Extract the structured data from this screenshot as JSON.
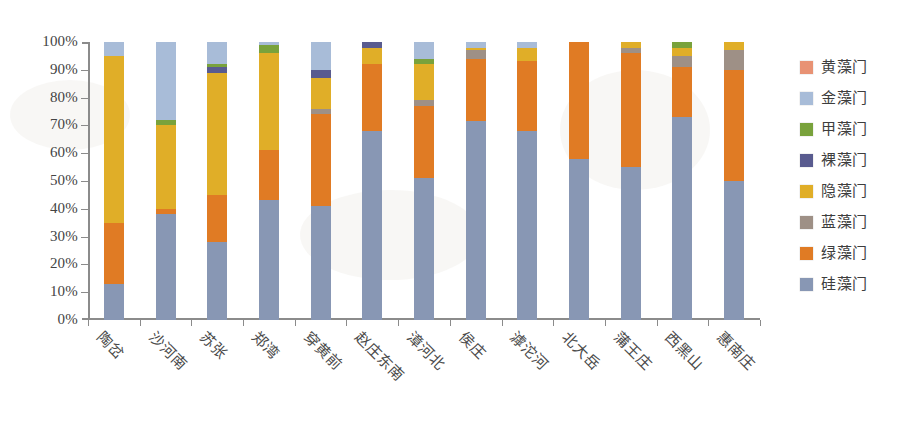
{
  "chart_data": {
    "type": "bar",
    "subtype": "stacked-percent",
    "title": "",
    "xlabel": "",
    "ylabel": "",
    "ylim": [
      0,
      100
    ],
    "ytick_labels": [
      "0%",
      "10%",
      "20%",
      "30%",
      "40%",
      "50%",
      "60%",
      "70%",
      "80%",
      "90%",
      "100%"
    ],
    "ytick_values": [
      0,
      10,
      20,
      30,
      40,
      50,
      60,
      70,
      80,
      90,
      100
    ],
    "grid": false,
    "legend_position": "right",
    "stack_order_bottom_to_top": [
      "硅藻门",
      "绿藻门",
      "蓝藻门",
      "隐藻门",
      "裸藻门",
      "甲藻门",
      "金藻门",
      "黄藻门"
    ],
    "categories": [
      "陶岔",
      "沙河南",
      "苏张",
      "郑湾",
      "穿黄前",
      "赵庄东南",
      "漳河北",
      "侯庄",
      "滹沱河",
      "北大岳",
      "蒲王庄",
      "西黑山",
      "惠南庄"
    ],
    "series": [
      {
        "name": "硅藻门",
        "color": "#8897b4",
        "values": [
          13,
          38,
          28,
          43,
          41,
          68,
          51,
          71.5,
          68,
          58,
          55,
          73,
          50
        ]
      },
      {
        "name": "绿藻门",
        "color": "#e07b24",
        "values": [
          22,
          2,
          17,
          18,
          33,
          24,
          26,
          22.5,
          25,
          42,
          41,
          18,
          40
        ]
      },
      {
        "name": "蓝藻门",
        "color": "#9e9086",
        "values": [
          0,
          0,
          0,
          0,
          2,
          0,
          2,
          3,
          0,
          0,
          2,
          4,
          7
        ]
      },
      {
        "name": "隐藻门",
        "color": "#e0ae28",
        "values": [
          60,
          30,
          44,
          35,
          11,
          6,
          13,
          1,
          5,
          0,
          2,
          3,
          3
        ]
      },
      {
        "name": "裸藻门",
        "color": "#595b8f",
        "values": [
          0,
          0,
          2,
          0,
          3,
          2,
          0,
          0,
          0,
          0,
          0,
          0,
          0
        ]
      },
      {
        "name": "甲藻门",
        "color": "#79a23c",
        "values": [
          0,
          2,
          1,
          3,
          0,
          0,
          2,
          0,
          0,
          0,
          0,
          2,
          0
        ]
      },
      {
        "name": "金藻门",
        "color": "#a8bcd8",
        "values": [
          5,
          28,
          8,
          1,
          10,
          0,
          6,
          2,
          2,
          0,
          0,
          0,
          0
        ]
      },
      {
        "name": "黄藻门",
        "color": "#e89274",
        "values": [
          0,
          0,
          0,
          0,
          0,
          0,
          0,
          0,
          0,
          0,
          0,
          0,
          0
        ]
      }
    ]
  },
  "legend": {
    "items": [
      {
        "label": "黄藻门",
        "color": "#e89274"
      },
      {
        "label": "金藻门",
        "color": "#a8bcd8"
      },
      {
        "label": "甲藻门",
        "color": "#79a23c"
      },
      {
        "label": "裸藻门",
        "color": "#595b8f"
      },
      {
        "label": "隐藻门",
        "color": "#e0ae28"
      },
      {
        "label": "蓝藻门",
        "color": "#9e9086"
      },
      {
        "label": "绿藻门",
        "color": "#e07b24"
      },
      {
        "label": "硅藻门",
        "color": "#8897b4"
      }
    ]
  },
  "axes": {
    "y_labels": [
      "100%",
      "90%",
      "80%",
      "70%",
      "60%",
      "50%",
      "40%",
      "30%",
      "20%",
      "10%",
      "0%"
    ],
    "x_labels": [
      "陶岔",
      "沙河南",
      "苏张",
      "郑湾",
      "穿黄前",
      "赵庄东南",
      "漳河北",
      "侯庄",
      "滹沱河",
      "北大岳",
      "蒲王庄",
      "西黑山",
      "惠南庄"
    ]
  }
}
